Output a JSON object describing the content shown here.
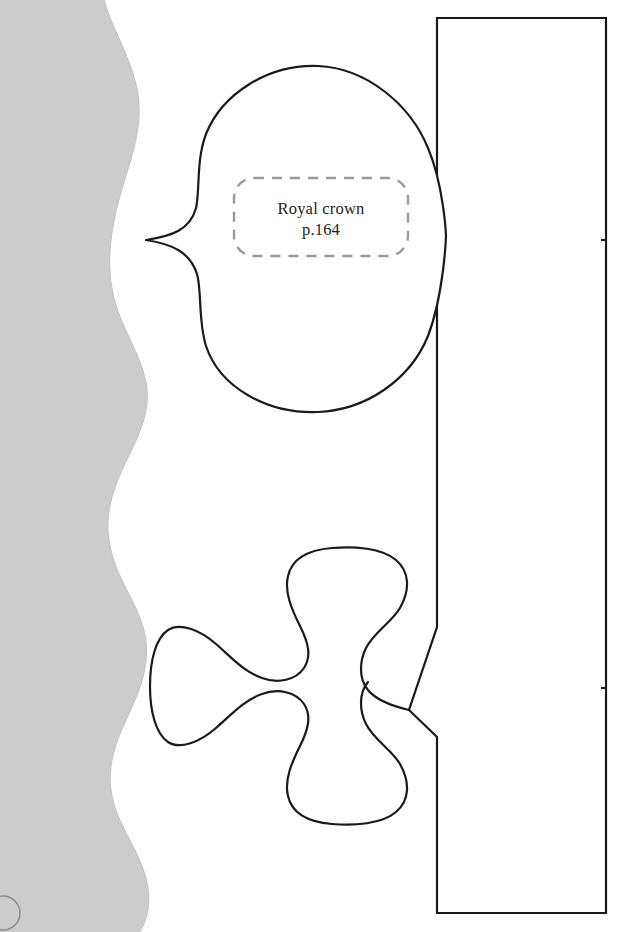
{
  "page": {
    "name": "sewing-pattern-template-page",
    "background_color": "#ffffff",
    "width": 617,
    "height": 932
  },
  "decor": {
    "wave_band": {
      "name": "wavy-gray-band",
      "fill": "#cccccc",
      "description": "scalloped vertical gray band along left page edge"
    },
    "corner_circle": {
      "name": "corner-circle-mark",
      "stroke": "#8c8c8c",
      "description": "partial circle outline at bottom-left corner"
    }
  },
  "label": {
    "name": "pattern-label",
    "line1": "Royal crown",
    "line2": "p.164",
    "box_stroke": "#9a9a9a",
    "text_color": "#231f20"
  },
  "shapes": {
    "stroke_color": "#1a1a1a",
    "fill_color": "#ffffff",
    "items": [
      {
        "name": "heart-leaf-piece",
        "type": "heart",
        "label": "Royal crown p.164"
      },
      {
        "name": "clover-piece",
        "type": "clover",
        "label": ""
      },
      {
        "name": "rectangle-panel-piece",
        "type": "rectangle",
        "label": ""
      }
    ]
  }
}
